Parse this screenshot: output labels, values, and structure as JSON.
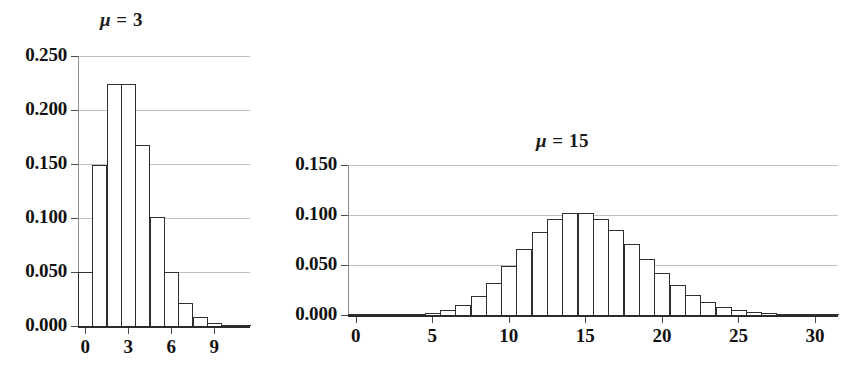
{
  "chart_data": [
    {
      "id": "poisson-mu-3",
      "type": "bar",
      "title": "μ = 3",
      "title_mu": "μ",
      "title_rest": " = 3",
      "xlabel": "",
      "ylabel": "",
      "ylim": [
        0.0,
        0.25
      ],
      "xlim": [
        -0.5,
        11.5
      ],
      "grid": true,
      "legend": "none",
      "ytick_labels": [
        "0.250",
        "0.200",
        "0.150",
        "0.100",
        "0.050",
        "0.000"
      ],
      "ytick_values": [
        0.25,
        0.2,
        0.15,
        0.1,
        0.05,
        0.0
      ],
      "xtick_labels": [
        "0",
        "3",
        "6",
        "9"
      ],
      "xtick_values": [
        0,
        3,
        6,
        9
      ],
      "categories": [
        0,
        1,
        2,
        3,
        4,
        5,
        6,
        7,
        8,
        9,
        10,
        11
      ],
      "values": [
        0.0498,
        0.1494,
        0.224,
        0.224,
        0.168,
        0.1008,
        0.0504,
        0.0216,
        0.0081,
        0.0027,
        0.0008,
        0.0002
      ]
    },
    {
      "id": "poisson-mu-15",
      "type": "bar",
      "title": "μ = 15",
      "title_mu": "μ",
      "title_rest": " = 15",
      "xlabel": "",
      "ylabel": "",
      "ylim": [
        0.0,
        0.15
      ],
      "xlim": [
        -0.5,
        31.5
      ],
      "grid": true,
      "legend": "none",
      "ytick_labels": [
        "0.150",
        "0.100",
        "0.050",
        "0.000"
      ],
      "ytick_values": [
        0.15,
        0.1,
        0.05,
        0.0
      ],
      "xtick_labels": [
        "0",
        "5",
        "10",
        "15",
        "20",
        "25",
        "30"
      ],
      "xtick_values": [
        0,
        5,
        10,
        15,
        20,
        25,
        30
      ],
      "categories": [
        0,
        1,
        2,
        3,
        4,
        5,
        6,
        7,
        8,
        9,
        10,
        11,
        12,
        13,
        14,
        15,
        16,
        17,
        18,
        19,
        20,
        21,
        22,
        23,
        24,
        25,
        26,
        27,
        28,
        29,
        30,
        31
      ],
      "values": [
        0.0,
        0.0,
        0.0,
        0.0002,
        0.0006,
        0.0019,
        0.0048,
        0.0104,
        0.0194,
        0.0324,
        0.0486,
        0.0663,
        0.0829,
        0.0956,
        0.1024,
        0.1024,
        0.096,
        0.0847,
        0.0706,
        0.0557,
        0.0418,
        0.0299,
        0.0204,
        0.0133,
        0.0083,
        0.005,
        0.0029,
        0.0016,
        0.0009,
        0.0004,
        0.0002,
        0.0001
      ]
    }
  ]
}
